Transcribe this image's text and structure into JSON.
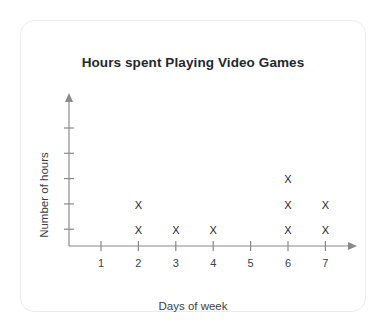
{
  "card": {
    "background_color": "#ffffff",
    "border_color": "#ececec"
  },
  "chart_data": {
    "type": "scatter",
    "title": "Hours spent Playing Video Games",
    "xlabel": "Days of week",
    "ylabel": "Number of hours",
    "marker": "X",
    "marker_color": "#1d1d1f",
    "axis_color": "#8a8a8a",
    "grid": false,
    "legend": null,
    "categories": [
      "1",
      "2",
      "3",
      "4",
      "5",
      "6",
      "7"
    ],
    "x": [
      1,
      2,
      3,
      4,
      5,
      6,
      7
    ],
    "values": [
      0,
      2,
      1,
      1,
      0,
      3,
      2
    ],
    "xlim": [
      0,
      7
    ],
    "ylim": [
      0,
      5
    ],
    "xticks": [
      "1",
      "2",
      "3",
      "4",
      "5",
      "6",
      "7"
    ],
    "yticks": [
      "",
      "",
      "",
      "",
      ""
    ],
    "points": [
      {
        "day": 2,
        "level": 1
      },
      {
        "day": 2,
        "level": 2
      },
      {
        "day": 3,
        "level": 1
      },
      {
        "day": 4,
        "level": 1
      },
      {
        "day": 6,
        "level": 1
      },
      {
        "day": 6,
        "level": 2
      },
      {
        "day": 6,
        "level": 3
      },
      {
        "day": 7,
        "level": 1
      },
      {
        "day": 7,
        "level": 2
      }
    ]
  },
  "geometry": {
    "y_axis_x": 68,
    "x_axis_y": 245,
    "x_start": 100,
    "x_step": 37.4,
    "row_base_y": 229,
    "row_step": 25.3,
    "y_tick_top": 127,
    "y_tick_step": 25.3,
    "y_tick_count": 5,
    "y_axis_top": 99,
    "x_axis_right": 349
  }
}
